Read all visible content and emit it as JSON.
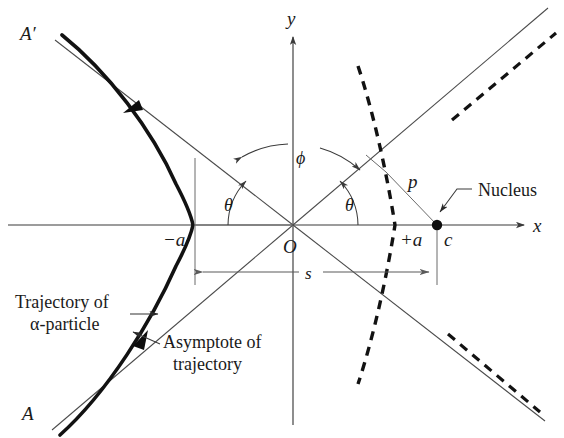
{
  "figure": {
    "background_color": "#ffffff",
    "ink_color": "#1a1a1a",
    "accent_color": "#121212"
  },
  "axes": {
    "x_label": "x",
    "y_label": "y",
    "origin_label": "O",
    "x_axis_y": 225,
    "y_axis_x": 293,
    "x_axis_start": 8,
    "x_axis_end": 528,
    "y_axis_top": 33,
    "y_axis_bottom": 425
  },
  "labels": {
    "asymptote_upper_left": "A′",
    "asymptote_lower_left": "A",
    "vertex_left": "−a",
    "vertex_right": "+a",
    "focus_distance": "c",
    "impact_parameter": "p",
    "separation": "s",
    "angle_theta_left": "θ",
    "angle_theta_right": "θ",
    "angle_phi": "ϕ",
    "nucleus": "Nucleus",
    "trajectory_line1": "Trajectory of",
    "trajectory_line2": "α-particle",
    "asymptote_line1": "Asymptote of",
    "asymptote_line2": "trajectory"
  },
  "geometry": {
    "origin": {
      "x": 293,
      "y": 225
    },
    "vertex_left": {
      "x": 193,
      "y": 225
    },
    "vertex_right": {
      "x": 395,
      "y": 225
    },
    "nucleus": {
      "x": 437,
      "y": 225
    },
    "asymptote_slope_deg": 42,
    "s_line_y": 272,
    "s_left_x": 195,
    "s_right_x": 437,
    "perpendicular_foot": {
      "x": 388,
      "y": 176
    }
  },
  "icons": {
    "nucleus_point": "filled-circle",
    "axis_arrow": "arrowhead",
    "direction_marker": "trajectory-arrow"
  }
}
